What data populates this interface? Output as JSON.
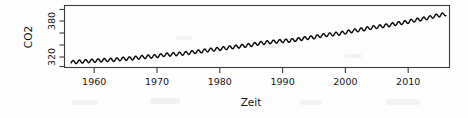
{
  "figure": {
    "name": "co2-time-series-plot",
    "background_color": "#fdfdfd",
    "line_color": "#0a0a0a",
    "axis_color": "#3c3c3c"
  },
  "chart_data": {
    "type": "line",
    "title": "",
    "subtitle": "",
    "xlabel": "Zeit",
    "ylabel": "CO2",
    "xlim": [
      1957.0,
      2018.5
    ],
    "ylim": [
      305,
      425
    ],
    "grid": false,
    "legend": null,
    "legend_position": "none",
    "box": "full",
    "xticks": [
      1960,
      1970,
      1980,
      1990,
      2000,
      2010
    ],
    "xtick_labels": [
      "1960",
      "1970",
      "1980",
      "1990",
      "2000",
      "2010"
    ],
    "yticks": [
      300,
      320,
      340,
      360,
      380,
      400
    ],
    "ytick_labels": [
      "",
      "320",
      "",
      "",
      "380",
      ""
    ],
    "ylabeled_ticks": [
      320,
      380
    ],
    "annotations": [],
    "series": [
      {
        "name": "Mauna Loa CO2 (ppm)",
        "description": "Monthly mean atmospheric CO2 concentration with seasonal sawtooth oscillation superimposed on a rising trend",
        "seasonal_amplitude_ppm": 3.2,
        "x": [
          1958.0,
          1959.0,
          1960.0,
          1961.0,
          1962.0,
          1963.0,
          1964.0,
          1965.0,
          1966.0,
          1967.0,
          1968.0,
          1969.0,
          1970.0,
          1971.0,
          1972.0,
          1973.0,
          1974.0,
          1975.0,
          1976.0,
          1977.0,
          1978.0,
          1979.0,
          1980.0,
          1981.0,
          1982.0,
          1983.0,
          1984.0,
          1985.0,
          1986.0,
          1987.0,
          1988.0,
          1989.0,
          1990.0,
          1991.0,
          1992.0,
          1993.0,
          1994.0,
          1995.0,
          1996.0,
          1997.0,
          1998.0,
          1999.0,
          2000.0,
          2001.0,
          2002.0,
          2003.0,
          2004.0,
          2005.0,
          2006.0,
          2007.0,
          2008.0,
          2009.0,
          2010.0,
          2011.0,
          2012.0,
          2013.0,
          2014.0,
          2015.0,
          2016.0,
          2017.0,
          2018.0
        ],
        "values": [
          315.3,
          315.9,
          316.9,
          317.6,
          318.4,
          319.0,
          319.6,
          320.0,
          321.4,
          322.2,
          323.0,
          324.6,
          325.7,
          326.3,
          327.5,
          329.7,
          330.2,
          331.1,
          332.0,
          333.8,
          335.4,
          336.8,
          338.7,
          340.1,
          341.4,
          343.0,
          344.6,
          346.0,
          347.4,
          349.2,
          351.6,
          353.1,
          354.4,
          355.6,
          356.4,
          357.1,
          358.8,
          360.8,
          362.6,
          363.8,
          366.6,
          368.3,
          369.5,
          371.0,
          373.2,
          375.8,
          377.5,
          379.8,
          381.9,
          383.8,
          385.6,
          387.4,
          389.9,
          391.6,
          393.9,
          396.5,
          398.6,
          400.8,
          404.2,
          406.5,
          408.5
        ]
      }
    ]
  }
}
